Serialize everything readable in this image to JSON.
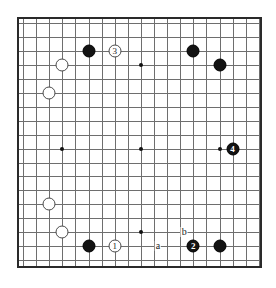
{
  "figure": {
    "kind": "go-board-diagram",
    "board_size": 19,
    "visible_columns": 18,
    "visible_rows": 18,
    "colors": {
      "black_stone": "#131313",
      "white_stone": "#ffffff",
      "grid_line": "#6e6e6e",
      "board_border": "#2a2a2a",
      "background": "#ffffff",
      "label_text": "#1c1c1c"
    }
  },
  "board": {
    "grid": {
      "cell_w": 13.1,
      "cell_h": 13.95,
      "cols": 18,
      "rows": 18
    },
    "star_points": [
      {
        "name": "star-left-middle",
        "col": 3,
        "row": 9
      },
      {
        "name": "star-center",
        "col": 9,
        "row": 9
      },
      {
        "name": "star-center-top",
        "col": 9,
        "row": 3
      },
      {
        "name": "star-center-bottom",
        "col": 9,
        "row": 15
      },
      {
        "name": "star-right-middle",
        "col": 15,
        "row": 9
      }
    ],
    "stones": [
      {
        "name": "black-stone-top-left",
        "color": "black",
        "col": 5,
        "row": 2,
        "label": ""
      },
      {
        "name": "white-stone-move-3",
        "color": "white",
        "col": 7,
        "row": 2,
        "label": "3"
      },
      {
        "name": "black-stone-top-right-a",
        "color": "black",
        "col": 13,
        "row": 2,
        "label": ""
      },
      {
        "name": "white-stone-upper-left-a",
        "color": "white",
        "col": 3,
        "row": 3,
        "label": ""
      },
      {
        "name": "black-stone-top-right-b",
        "color": "black",
        "col": 15,
        "row": 3,
        "label": ""
      },
      {
        "name": "white-stone-upper-left-b",
        "color": "white",
        "col": 2,
        "row": 5,
        "label": ""
      },
      {
        "name": "black-stone-move-4",
        "color": "black",
        "col": 16,
        "row": 9,
        "label": "4"
      },
      {
        "name": "white-stone-lower-left-a",
        "color": "white",
        "col": 2,
        "row": 13,
        "label": ""
      },
      {
        "name": "white-stone-lower-left-b",
        "color": "white",
        "col": 3,
        "row": 15,
        "label": ""
      },
      {
        "name": "black-stone-bottom-right",
        "color": "black",
        "col": 15,
        "row": 16,
        "label": ""
      },
      {
        "name": "black-stone-bottom-left",
        "color": "black",
        "col": 5,
        "row": 16,
        "label": ""
      },
      {
        "name": "white-stone-move-1",
        "color": "white",
        "col": 7,
        "row": 16,
        "label": "1"
      },
      {
        "name": "black-stone-move-2",
        "color": "black",
        "col": 13,
        "row": 16,
        "label": "2"
      }
    ],
    "point_labels": [
      {
        "name": "point-label-a",
        "text": "a",
        "col": 10.3,
        "row": 16.0
      },
      {
        "name": "point-label-b",
        "text": "b",
        "col": 12.3,
        "row": 15.0
      }
    ]
  }
}
